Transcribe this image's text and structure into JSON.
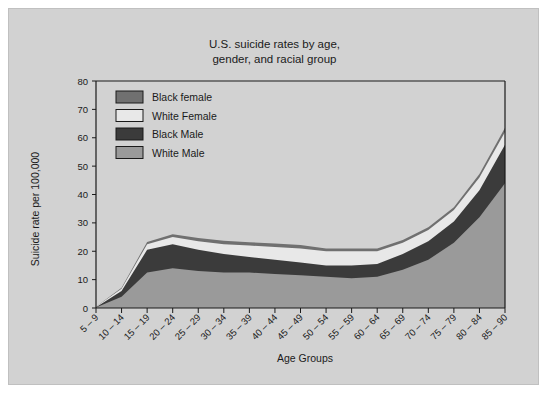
{
  "chart_data": {
    "type": "area",
    "stacked": true,
    "title": "U.S. suicide rates by age, gender, and racial group",
    "title_line1": "U.S. suicide rates by age,",
    "title_line2": "gender, and racial group",
    "xlabel": "Age Groups",
    "ylabel": "Suicide rate per 100,000",
    "ylim": [
      0,
      80
    ],
    "yticks": [
      0,
      10,
      20,
      30,
      40,
      50,
      60,
      70,
      80
    ],
    "grid": false,
    "legend_position": "top-left-inside",
    "categories": [
      "5 – 9",
      "10 – 14",
      "15 – 19",
      "20 – 24",
      "25 – 29",
      "30 – 34",
      "35 – 39",
      "40 – 44",
      "45 – 49",
      "50 – 54",
      "55 – 59",
      "60 – 64",
      "65 – 69",
      "70 – 74",
      "75 – 79",
      "80 – 84",
      "85 – 90"
    ],
    "series": [
      {
        "name": "White Male",
        "color": "#9a9a9a",
        "values": [
          0.2,
          4.0,
          12.5,
          14.0,
          13.0,
          12.5,
          12.5,
          12.0,
          11.5,
          11.0,
          10.5,
          11.0,
          13.5,
          17.0,
          23.0,
          32.0,
          44.0
        ]
      },
      {
        "name": "Black Male",
        "color": "#3b3b3b",
        "values": [
          0.1,
          2.0,
          8.0,
          8.5,
          7.5,
          6.5,
          5.5,
          5.0,
          4.5,
          4.0,
          4.5,
          4.5,
          5.5,
          6.5,
          7.5,
          9.5,
          13.5
        ]
      },
      {
        "name": "White Female",
        "color": "#e8e8e8",
        "values": [
          0.1,
          0.8,
          2.0,
          2.5,
          3.0,
          3.5,
          4.0,
          4.5,
          5.0,
          5.0,
          5.0,
          4.5,
          4.0,
          4.0,
          4.0,
          4.5,
          4.5
        ]
      },
      {
        "name": "Black female",
        "color": "#707070",
        "values": [
          0.0,
          0.3,
          0.8,
          1.0,
          1.2,
          1.2,
          1.2,
          1.2,
          1.2,
          1.0,
          1.0,
          1.0,
          1.0,
          1.0,
          1.0,
          1.2,
          1.5
        ]
      }
    ],
    "legend_entries": [
      {
        "label": "Black female",
        "color": "#707070"
      },
      {
        "label": "White Female",
        "color": "#e8e8e8"
      },
      {
        "label": "Black Male",
        "color": "#3b3b3b"
      },
      {
        "label": "White Male",
        "color": "#9a9a9a"
      }
    ]
  },
  "colors": {
    "panel_background": "#d2d2d2",
    "page_background": "#ffffff",
    "axis": "#1a1a1a"
  }
}
